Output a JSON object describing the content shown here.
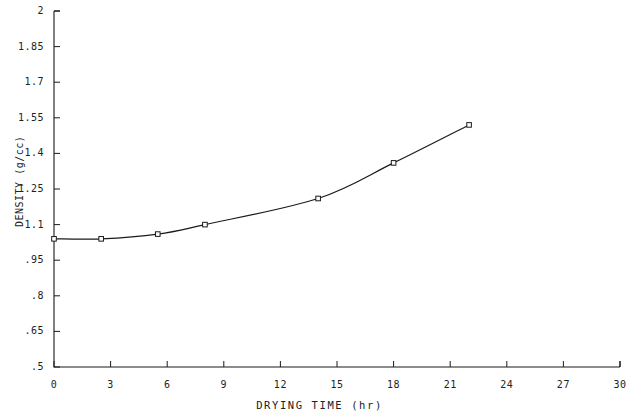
{
  "chart_data": {
    "type": "line",
    "title": "",
    "xlabel": "DRYING TIME (hr)",
    "ylabel": "DENSITY (g/cc)",
    "xlim": [
      0,
      30
    ],
    "ylim": [
      0.5,
      2
    ],
    "xticks": [
      "0",
      "3",
      "6",
      "9",
      "12",
      "15",
      "18",
      "21",
      "24",
      "27",
      "30"
    ],
    "xtick_values": [
      0,
      3,
      6,
      9,
      12,
      15,
      18,
      21,
      24,
      27,
      30
    ],
    "yticks": [
      "2",
      "1.85",
      "1.7",
      "1.55",
      "1.4",
      "1.25",
      "1.1",
      ".95",
      ".8",
      ".65",
      ".5"
    ],
    "ytick_values": [
      2,
      1.85,
      1.7,
      1.55,
      1.4,
      1.25,
      1.1,
      0.95,
      0.8,
      0.65,
      0.5
    ],
    "grid": false,
    "legend": null,
    "marker": "square-open",
    "line_color": "#1a1a1a",
    "series": [
      {
        "name": "density",
        "x": [
          0,
          2.5,
          5.5,
          8,
          14,
          18,
          22
        ],
        "y": [
          1.04,
          1.04,
          1.06,
          1.1,
          1.21,
          1.36,
          1.52
        ]
      }
    ]
  },
  "axis_title_x": "DRYING TIME (hr)",
  "axis_title_y": "DENSITY (g/cc)"
}
